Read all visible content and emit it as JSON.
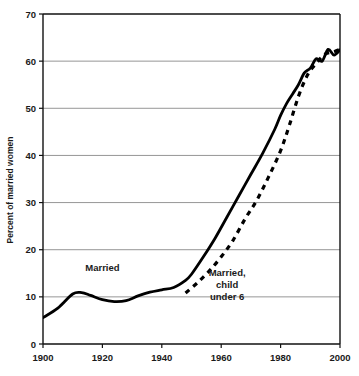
{
  "chart_data": {
    "type": "line",
    "title": "",
    "xlabel": "",
    "ylabel": "Percent of married women",
    "xlim": [
      1900,
      2000
    ],
    "ylim": [
      0,
      70
    ],
    "xticks": [
      1900,
      1920,
      1940,
      1960,
      1980,
      2000
    ],
    "xtick_labels": [
      "1900",
      "1920",
      "1940",
      "1960",
      "1980",
      "2000"
    ],
    "yticks": [
      0,
      10,
      20,
      30,
      40,
      50,
      60,
      70
    ],
    "ytick_labels": [
      "0",
      "10",
      "20",
      "30",
      "40",
      "50",
      "60",
      "70"
    ],
    "grid": "horizontal",
    "gridlines_at": [
      10,
      20,
      30,
      40,
      50,
      60
    ],
    "legend_position": "inline-annotation",
    "annotations": [
      {
        "name": "married-label",
        "text": "Married",
        "lines": [
          "Married"
        ],
        "x": 1920,
        "y": 15.5
      },
      {
        "name": "married-child-under-6-label",
        "text": "Married, child under 6",
        "lines": [
          "Married,",
          "child",
          "under 6"
        ],
        "x": 1962,
        "y": 14.5
      }
    ],
    "series": [
      {
        "name": "Married",
        "label": "Married",
        "style": "solid",
        "color": "#000000",
        "x": [
          1900,
          1905,
          1910,
          1913,
          1916,
          1920,
          1924,
          1928,
          1932,
          1936,
          1940,
          1944,
          1948,
          1950,
          1954,
          1958,
          1962,
          1966,
          1970,
          1974,
          1978,
          1980,
          1982,
          1984,
          1986,
          1988,
          1990,
          1992,
          1994,
          1996,
          1998,
          2000
        ],
        "values": [
          5.6,
          7.6,
          10.6,
          10.9,
          10.3,
          9.4,
          9.0,
          9.2,
          10.2,
          11.0,
          11.5,
          12.0,
          13.5,
          14.8,
          18.5,
          22.5,
          27.0,
          31.5,
          36.0,
          40.5,
          45.5,
          48.5,
          51.0,
          53.0,
          55.0,
          57.5,
          58.5,
          60.5,
          60.0,
          62.5,
          61.3,
          62.4
        ]
      },
      {
        "name": "Married, child under 6",
        "label": "Married, child under 6",
        "style": "dashed",
        "color": "#000000",
        "x": [
          1948,
          1952,
          1956,
          1960,
          1964,
          1968,
          1972,
          1976,
          1980,
          1983,
          1986,
          1989,
          1992,
          1995,
          1998,
          2000
        ],
        "values": [
          10.8,
          13.0,
          15.5,
          18.5,
          22.0,
          26.5,
          30.5,
          35.5,
          41.0,
          46.5,
          52.5,
          57.0,
          59.5,
          61.5,
          62.0,
          62.5
        ]
      }
    ]
  }
}
